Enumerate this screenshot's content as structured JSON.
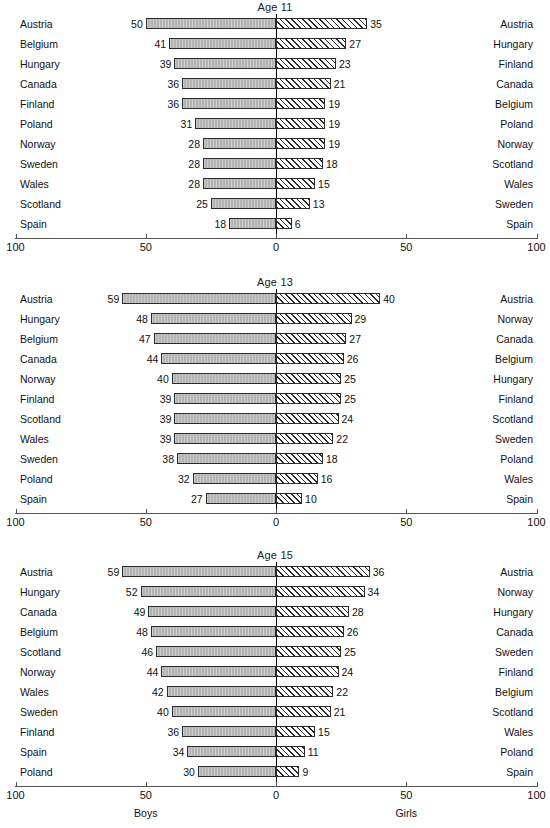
{
  "figure": {
    "axis_ticks": [
      {
        "label": "100",
        "pos": -100
      },
      {
        "label": "50",
        "pos": -50
      },
      {
        "label": "0",
        "pos": 0
      },
      {
        "label": "50",
        "pos": 50
      },
      {
        "label": "100",
        "pos": 100
      }
    ],
    "caption_left": "Boys",
    "caption_right": "Girls",
    "colors": {
      "boys_fill": "#b4b4b4",
      "girls_fill": "#ffffff",
      "bar_border": "#2b2b2b",
      "axis": "#555555",
      "zero_line": "#000000",
      "text": "#111111"
    }
  },
  "chart_data": [
    {
      "type": "bar",
      "title": "Age 11",
      "xlabel": "",
      "ylabel": "",
      "xlim": [
        -100,
        100
      ],
      "grid": false,
      "legend": [
        "Boys",
        "Girls"
      ],
      "orientation": "horizontal-diverging",
      "left_categories": [
        "Austria",
        "Belgium",
        "Hungary",
        "Canada",
        "Finland",
        "Poland",
        "Norway",
        "Sweden",
        "Wales",
        "Scotland",
        "Spain"
      ],
      "left_values": [
        50,
        41,
        39,
        36,
        36,
        31,
        28,
        28,
        28,
        25,
        18
      ],
      "right_categories": [
        "Austria",
        "Hungary",
        "Finland",
        "Canada",
        "Belgium",
        "Poland",
        "Norway",
        "Scotland",
        "Wales",
        "Sweden",
        "Spain"
      ],
      "right_values": [
        35,
        27,
        23,
        21,
        19,
        19,
        19,
        18,
        15,
        13,
        6
      ]
    },
    {
      "type": "bar",
      "title": "Age 13",
      "xlabel": "",
      "ylabel": "",
      "xlim": [
        -100,
        100
      ],
      "grid": false,
      "legend": [
        "Boys",
        "Girls"
      ],
      "orientation": "horizontal-diverging",
      "left_categories": [
        "Austria",
        "Hungary",
        "Belgium",
        "Canada",
        "Norway",
        "Finland",
        "Scotland",
        "Wales",
        "Sweden",
        "Poland",
        "Spain"
      ],
      "left_values": [
        59,
        48,
        47,
        44,
        40,
        39,
        39,
        39,
        38,
        32,
        27
      ],
      "right_categories": [
        "Austria",
        "Norway",
        "Canada",
        "Belgium",
        "Hungary",
        "Finland",
        "Scotland",
        "Sweden",
        "Poland",
        "Wales",
        "Spain"
      ],
      "right_values": [
        40,
        29,
        27,
        26,
        25,
        25,
        24,
        22,
        18,
        16,
        10
      ]
    },
    {
      "type": "bar",
      "title": "Age 15",
      "xlabel": "",
      "ylabel": "",
      "xlim": [
        -100,
        100
      ],
      "grid": false,
      "legend": [
        "Boys",
        "Girls"
      ],
      "orientation": "horizontal-diverging",
      "left_categories": [
        "Austria",
        "Hungary",
        "Canada",
        "Belgium",
        "Scotland",
        "Norway",
        "Wales",
        "Sweden",
        "Finland",
        "Spain",
        "Poland"
      ],
      "left_values": [
        59,
        52,
        49,
        48,
        46,
        44,
        42,
        40,
        36,
        34,
        30
      ],
      "right_categories": [
        "Austria",
        "Norway",
        "Hungary",
        "Canada",
        "Sweden",
        "Finland",
        "Belgium",
        "Scotland",
        "Wales",
        "Poland",
        "Spain"
      ],
      "right_values": [
        36,
        34,
        28,
        26,
        25,
        24,
        22,
        21,
        15,
        11,
        9
      ]
    }
  ]
}
